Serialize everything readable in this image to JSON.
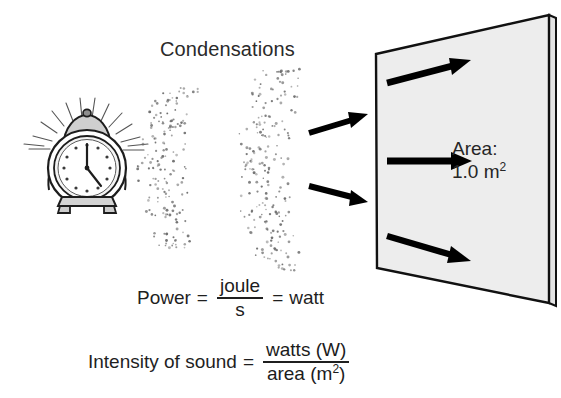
{
  "diagram": {
    "title_label": "Condensations",
    "source_icon": "alarm-clock-icon",
    "wave_icon": "sound-wave-dots",
    "panel": {
      "area_title": "Area:",
      "area_value": "1.0 m",
      "area_exponent": "2",
      "fill_color": "#ededed",
      "edge_color": "#111111"
    },
    "arrows": {
      "incoming_count": 3,
      "on_panel_count": 3,
      "color": "#000000"
    }
  },
  "formulas": {
    "power": {
      "lhs": "Power",
      "equals_1": "=",
      "numerator": "joule",
      "denominator": "s",
      "equals_2": "=",
      "rhs": "watt"
    },
    "intensity": {
      "lhs": "Intensity of sound",
      "equals": "=",
      "numerator": "watts (W)",
      "denominator": "area (m",
      "denominator_exponent": "2",
      "denominator_tail": ")"
    }
  }
}
